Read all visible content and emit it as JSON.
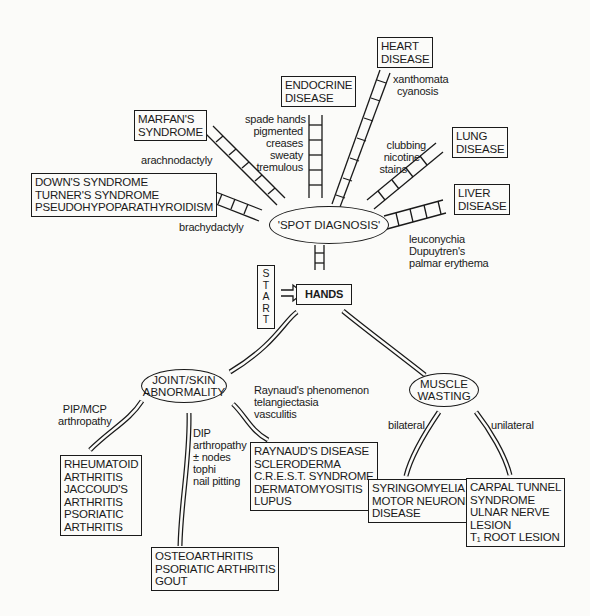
{
  "hub": {
    "label": "'SPOT DIAGNOSIS'"
  },
  "start": {
    "letters": [
      "S",
      "T",
      "A",
      "R",
      "T"
    ]
  },
  "hands": {
    "label": "HANDS"
  },
  "spot_branches": {
    "heart": {
      "box": [
        "HEART",
        "DISEASE"
      ],
      "signs": [
        "xanthomata",
        "cyanosis"
      ]
    },
    "endocrine": {
      "box": [
        "ENDOCRINE",
        "DISEASE"
      ],
      "signs": [
        "spade hands",
        "pigmented",
        "creases",
        "sweaty",
        "tremulous"
      ]
    },
    "marfan": {
      "box": [
        "MARFAN'S",
        "SYNDROME"
      ],
      "signs": [
        "arachnodactyly"
      ]
    },
    "down": {
      "box": [
        "DOWN'S SYNDROME",
        "TURNER'S SYNDROME",
        "PSEUDOHYPOPARATHYROIDISM"
      ],
      "signs": [
        "brachydactyly"
      ]
    },
    "lung": {
      "box": [
        "LUNG",
        "DISEASE"
      ],
      "signs": [
        "clubbing",
        "nicotine",
        "stains"
      ]
    },
    "liver": {
      "box": [
        "LIVER",
        "DISEASE"
      ],
      "signs": [
        "leuconychia",
        "Dupuytren's",
        "palmar erythema"
      ]
    }
  },
  "joint": {
    "node": [
      "JOINT/SKIN",
      "ABNORMALITY"
    ],
    "left": {
      "signs": [
        "PIP/MCP",
        "arthropathy"
      ],
      "box": [
        "RHEUMATOID",
        "ARTHRITIS",
        "JACCOUD'S",
        "ARTHRITIS",
        "PSORIATIC",
        "ARTHRITIS"
      ]
    },
    "middle": {
      "signs": [
        "DIP",
        "arthropathy",
        "± nodes",
        "tophi",
        "nail pitting"
      ],
      "box": [
        "OSTEOARTHRITIS",
        "PSORIATIC ARTHRITIS",
        "GOUT"
      ]
    },
    "right": {
      "signs": [
        "Raynaud's phenomenon",
        "telangiectasia",
        "vasculitis"
      ],
      "box": [
        "RAYNAUD'S DISEASE",
        "SCLERODERMA",
        "C.R.E.S.T. SYNDROME",
        "DERMATOMYOSITIS",
        "LUPUS"
      ]
    }
  },
  "muscle": {
    "node": [
      "MUSCLE",
      "WASTING"
    ],
    "bilateral": {
      "label": "bilateral",
      "box": [
        "SYRINGOMYELIA",
        "MOTOR NEURONE",
        "DISEASE"
      ]
    },
    "unilateral": {
      "label": "unilateral",
      "box": [
        "CARPAL TUNNEL",
        "SYNDROME",
        "ULNAR NERVE",
        "LESION",
        "T₁ ROOT LESION"
      ]
    }
  }
}
